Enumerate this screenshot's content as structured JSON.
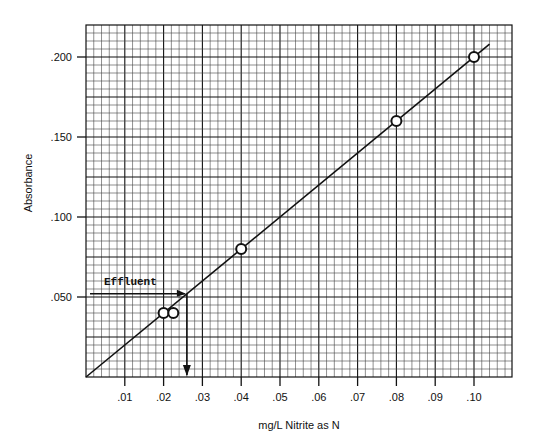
{
  "chart_data": {
    "type": "line",
    "title": "",
    "xlabel": "mg/L Nitrite as N",
    "ylabel": "Absorbance",
    "xlim": [
      0,
      0.11
    ],
    "ylim": [
      0,
      0.22
    ],
    "grid": true,
    "x_ticks": [
      0.01,
      0.02,
      0.03,
      0.04,
      0.05,
      0.06,
      0.07,
      0.08,
      0.09,
      0.1
    ],
    "x_tick_labels": [
      ".01",
      ".02",
      ".03",
      ".04",
      ".05",
      ".06",
      ".07",
      ".08",
      ".09",
      ".10"
    ],
    "y_ticks": [
      0.05,
      0.1,
      0.15,
      0.2
    ],
    "y_tick_labels": [
      ".050",
      ".100",
      ".150",
      ".200"
    ],
    "series": [
      {
        "name": "Standards",
        "kind": "scatter",
        "marker": "open-circle",
        "x": [
          0.02,
          0.0225,
          0.04,
          0.08,
          0.1
        ],
        "y": [
          0.04,
          0.04,
          0.08,
          0.16,
          0.2
        ]
      },
      {
        "name": "Calibration line",
        "kind": "line",
        "x": [
          0.0,
          0.104
        ],
        "y": [
          0.0,
          0.208
        ]
      }
    ],
    "annotations": [
      {
        "text": "Effluent",
        "type": "arrow-read",
        "absorbance": 0.052,
        "concentration": 0.026,
        "description": "Horizontal arrow from y-axis at absorbance .052 to calibration line, then vertical arrow down to x-axis at ~.026 mg/L"
      }
    ],
    "legend": null
  },
  "labels": {
    "xlabel": "mg/L Nitrite as N",
    "ylabel": "Absorbance",
    "effluent": "Effluent"
  },
  "colors": {
    "ink": "#111111",
    "grid_minor": "#555555",
    "background": "#ffffff"
  }
}
